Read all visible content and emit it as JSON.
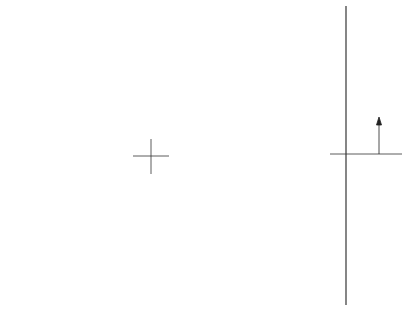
{
  "figure": {
    "type": "Fresnel zone plate diagram",
    "plan_view": {
      "center": [
        151,
        156
      ],
      "rings": [
        {
          "r": 43,
          "style": "dashed"
        },
        {
          "r": 61,
          "style": "solid"
        },
        {
          "r": 73,
          "style": "dashed"
        },
        {
          "r": 84,
          "style": "solid"
        },
        {
          "r": 94,
          "style": "dashed"
        },
        {
          "r": 103,
          "style": "solid"
        },
        {
          "r": 112,
          "style": "dashed"
        },
        {
          "r": 120,
          "style": "solid"
        },
        {
          "r": 128,
          "style": "dashed"
        },
        {
          "r": 134,
          "style": "solid"
        },
        {
          "r": 140,
          "style": "dashed"
        }
      ],
      "center_mark": "cross"
    },
    "cross_section": {
      "axis_label": "ρ",
      "description": "stepped profile of zone plate in side view"
    },
    "colors": {
      "line": "#222222",
      "background": "#ffffff"
    }
  }
}
